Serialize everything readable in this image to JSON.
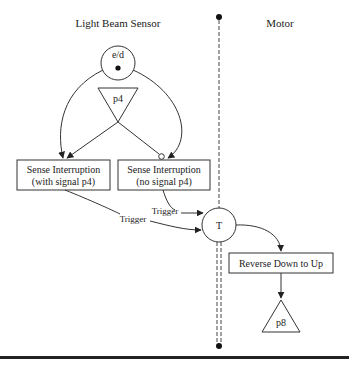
{
  "diagram": {
    "lanes": {
      "left": {
        "title": "Light Beam Sensor"
      },
      "right": {
        "title": "Motor"
      }
    },
    "places": {
      "ed": {
        "label": "e/d",
        "has_token": true
      },
      "p4": {
        "label": "p4"
      },
      "p8": {
        "label": "p8"
      }
    },
    "transitions": {
      "sense_with": {
        "line1": "Sense Interruption",
        "line2": "(with signal p4)"
      },
      "sense_no": {
        "line1": "Sense Interruption",
        "line2": "(no signal p4)"
      },
      "reverse": {
        "label": "Reverse Down to Up"
      }
    },
    "sync": {
      "label": "T"
    },
    "edges": {
      "trigger_no_signal": "Trigger",
      "trigger_with_signal": "Trigger"
    },
    "colors": {
      "stroke": "#333333",
      "text": "#222222",
      "background": "#ffffff"
    }
  }
}
